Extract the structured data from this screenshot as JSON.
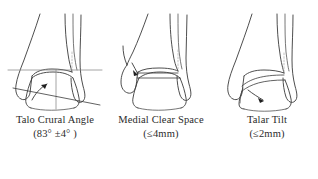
{
  "figure": {
    "background_color": "#ffffff",
    "line_color": "#3a3a3a",
    "reference_line_color": "#8d8d8d",
    "panel_count": 3
  },
  "panels": [
    {
      "id": "talo-crural-angle",
      "title": "Talo Crural Angle",
      "value": "(83° ±4° )",
      "measurement_name": "Talo Crural Angle",
      "normal_value": "83° ±4°",
      "annotations": {
        "horizontal_reference_line": true,
        "vertical_reference_line": true,
        "angled_talar_dome_line": true,
        "curved_angle_arrow": true,
        "syndesmosis_dotted_line": true
      }
    },
    {
      "id": "medial-clear-space",
      "title": "Medial Clear Space",
      "value": "(≤4mm)",
      "measurement_name": "Medial Clear Space",
      "normal_value": "≤4mm",
      "annotations": {
        "parallel_gap_lines": true,
        "pointer_arrow": true,
        "syndesmosis_dotted_line": true
      }
    },
    {
      "id": "talar-tilt",
      "title": "Talar Tilt",
      "value": "(≤2mm)",
      "measurement_name": "Talar Tilt",
      "normal_value": "≤2mm",
      "annotations": {
        "tilted_talar_dome_lines": true,
        "pointer_arrow": true,
        "syndesmosis_dotted_line": true
      }
    }
  ]
}
